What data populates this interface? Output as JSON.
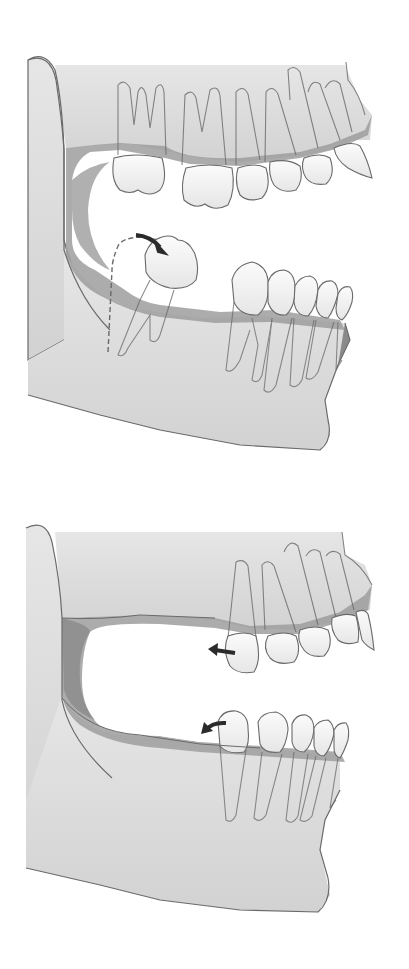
{
  "caption": {
    "text_fragment": "",
    "note": "top line of text is cropped; only lower edges of glyphs visible"
  },
  "figures": [
    {
      "id": "before",
      "label": "",
      "description": "Lateral view of jaw with tilted lower third molar; dashed outline marks extraction position; curved arrow shows tipping movement"
    },
    {
      "id": "after",
      "label": "",
      "description": "Lateral view of jaw after molar loss; arrows indicate mesial drift of upper and lower teeth"
    }
  ],
  "colors": {
    "bone": "#dcdcdc",
    "bone_shadow": "#c4c4c4",
    "gum": "#9e9e9e",
    "gum_dark": "#7c7c7c",
    "tooth": "#f4f4f4",
    "outline": "#6a6a6a",
    "arrow": "#2b2b2b"
  }
}
